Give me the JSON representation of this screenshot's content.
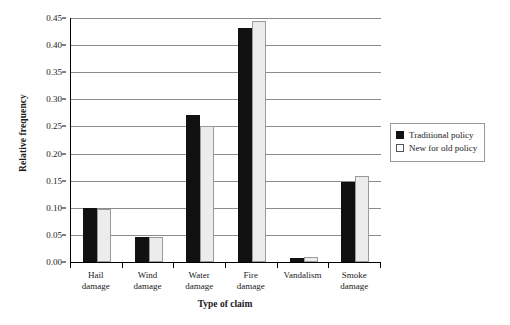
{
  "chart_data": {
    "type": "bar",
    "title": "",
    "xlabel": "Type of claim",
    "ylabel": "Relative frequency",
    "categories": [
      "Hail\ndamage",
      "Wind\ndamage",
      "Water\ndamage",
      "Fire\ndamage",
      "Vandalism",
      "Smoke\ndamage"
    ],
    "series": [
      {
        "name": "Traditional policy",
        "color": "#111111",
        "values": [
          0.1,
          0.046,
          0.272,
          0.432,
          0.007,
          0.147
        ]
      },
      {
        "name": "New for old policy",
        "color": "#ececec",
        "values": [
          0.097,
          0.047,
          0.251,
          0.445,
          0.009,
          0.158
        ]
      }
    ],
    "ylim": [
      0.0,
      0.45
    ],
    "ytick_step": 0.05,
    "yticks": [
      "0.00",
      "0.05",
      "0.10",
      "0.15",
      "0.20",
      "0.25",
      "0.30",
      "0.35",
      "0.40",
      "0.45"
    ],
    "ytick_values": [
      0.0,
      0.05,
      0.1,
      0.15,
      0.2,
      0.25,
      0.3,
      0.35,
      0.4,
      0.45
    ],
    "grid": "horizontal",
    "legend_position": "right"
  }
}
